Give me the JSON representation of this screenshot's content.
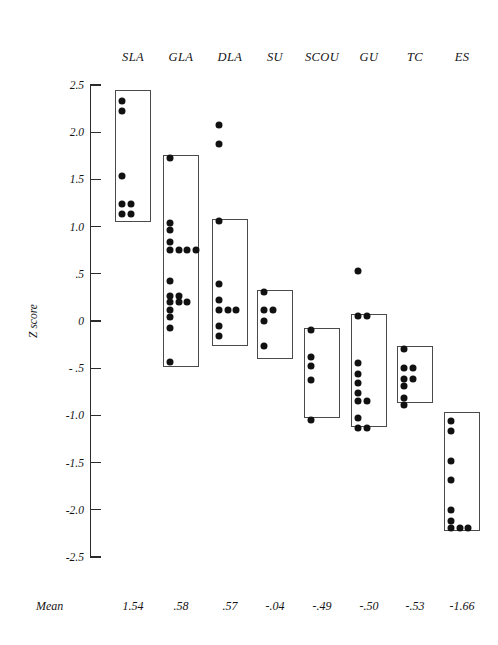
{
  "chart_data": {
    "type": "scatter",
    "title": "",
    "xlabel": "",
    "ylabel": "Z score",
    "ylim": [
      -2.5,
      2.5
    ],
    "ytick_values": [
      2.5,
      2.0,
      1.5,
      1.0,
      0.5,
      0,
      -0.5,
      -1.0,
      -1.5,
      -2.0,
      -2.5
    ],
    "ytick_labels": [
      "2.5",
      "2.0",
      "1.5",
      "1.0",
      ".5",
      "0",
      "- .5",
      "-1.0",
      "-1.5",
      "-2.0",
      "-2.5"
    ],
    "grid": false,
    "legend": "none",
    "categories": [
      "SLA",
      "GLA",
      "DLA",
      "SU",
      "SCOU",
      "GU",
      "TC",
      "ES"
    ],
    "mean_row_label": "Mean",
    "means": [
      "1.54",
      ".58",
      ".57",
      "-.04",
      "-.49",
      "-.50",
      "-.53",
      "-1.66"
    ],
    "groups": [
      {
        "name": "SLA",
        "mean": 1.54,
        "box_range": [
          1.05,
          2.45
        ],
        "values": [
          2.33,
          2.22,
          1.54,
          1.24,
          1.24,
          1.13,
          1.13
        ]
      },
      {
        "name": "GLA",
        "mean": 0.58,
        "box_range": [
          -0.49,
          1.76
        ],
        "values": [
          1.73,
          1.04,
          0.96,
          0.84,
          0.75,
          0.75,
          0.75,
          0.75,
          0.42,
          0.26,
          0.26,
          0.2,
          0.2,
          0.2,
          0.12,
          0.04,
          -0.07,
          -0.43
        ]
      },
      {
        "name": "DLA",
        "mean": 0.57,
        "box_range": [
          -0.27,
          1.08
        ],
        "values": [
          2.08,
          1.88,
          1.06,
          0.39,
          0.22,
          0.12,
          0.12,
          0.12,
          -0.05,
          -0.16
        ]
      },
      {
        "name": "SU",
        "mean": -0.04,
        "box_range": [
          -0.4,
          0.33
        ],
        "values": [
          0.31,
          0.12,
          0.12,
          0.0,
          -0.27
        ]
      },
      {
        "name": "SCOU",
        "mean": -0.49,
        "box_range": [
          -1.03,
          -0.07
        ],
        "values": [
          -0.1,
          -0.38,
          -0.48,
          -0.63,
          -1.05
        ]
      },
      {
        "name": "GU",
        "mean": -0.5,
        "box_range": [
          -1.12,
          0.07
        ],
        "values": [
          0.53,
          0.05,
          0.05,
          -0.45,
          -0.56,
          -0.66,
          -0.76,
          -0.85,
          -0.85,
          -1.03,
          -1.13,
          -1.13
        ]
      },
      {
        "name": "TC",
        "mean": -0.53,
        "box_range": [
          -0.87,
          -0.27
        ],
        "values": [
          -0.3,
          -0.5,
          -0.5,
          -0.61,
          -0.61,
          -0.69,
          -0.82,
          -0.89
        ]
      },
      {
        "name": "ES",
        "mean": -1.66,
        "box_range": [
          -2.23,
          -0.96
        ],
        "values": [
          -1.06,
          -1.17,
          -1.48,
          -1.68,
          -2.0,
          -2.12,
          -2.19,
          -2.19,
          -2.19
        ]
      }
    ]
  }
}
